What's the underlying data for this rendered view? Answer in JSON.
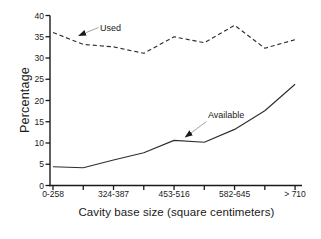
{
  "figure": {
    "background": "#ffffff",
    "ink": "#1a1a1a",
    "line_color": "#2e2e2e",
    "arrow_shaft_color": "#9a9a9a"
  },
  "chart_data": {
    "type": "line",
    "title": "",
    "xlabel": "Cavity base size (square centimeters)",
    "ylabel": "Percentage",
    "ylim": [
      0,
      40
    ],
    "y_ticks": [
      0,
      5,
      10,
      15,
      20,
      25,
      30,
      35,
      40
    ],
    "x_tick_labels": [
      "0-258",
      "",
      "324-387",
      "",
      "453-516",
      "",
      "582-645",
      "",
      "> 710"
    ],
    "grid": false,
    "legend_position": "inline-annotations",
    "series": [
      {
        "name": "Used",
        "line_style": "dashed",
        "values": [
          36.0,
          33.2,
          32.6,
          31.1,
          35.0,
          33.6,
          37.7,
          32.3,
          34.3
        ]
      },
      {
        "name": "Available",
        "line_style": "solid",
        "values": [
          4.4,
          4.2,
          6.0,
          7.7,
          10.6,
          10.2,
          13.2,
          17.6,
          23.8
        ]
      }
    ],
    "annotations": [
      {
        "label": "Used",
        "arrow": {
          "x1": 98.5,
          "y1": 27.5,
          "x2": 79,
          "y2": 35.5
        }
      },
      {
        "label": "Available",
        "arrow": {
          "x1": 206.5,
          "y1": 121.5,
          "x2": 185.5,
          "y2": 137
        }
      }
    ]
  }
}
